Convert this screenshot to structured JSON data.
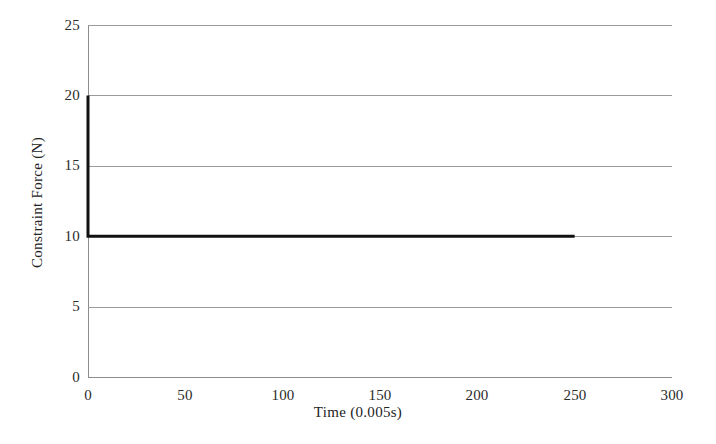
{
  "chart_data": {
    "type": "line",
    "title": "",
    "subtitle": "",
    "xlabel": "Time (0.005s)",
    "ylabel": "Constraint Force (N)",
    "xlim": [
      0,
      300
    ],
    "ylim": [
      0,
      25
    ],
    "x_ticks": [
      0,
      50,
      100,
      150,
      200,
      250,
      300
    ],
    "y_ticks": [
      0,
      5,
      10,
      15,
      20,
      25
    ],
    "x_tick_labels": [
      "0",
      "50",
      "100",
      "150",
      "200",
      "250",
      "300"
    ],
    "y_tick_labels": [
      "0",
      "5",
      "10",
      "15",
      "20",
      "25"
    ],
    "grid": {
      "horizontal": true,
      "vertical": false,
      "color": "#9a9a9a"
    },
    "legend": {
      "visible": false,
      "entries": []
    },
    "annotations": [],
    "series": [
      {
        "name": "Constraint Force",
        "color": "#111111",
        "line_width": 3,
        "x": [
          0,
          0,
          5,
          10,
          20,
          30,
          40,
          50,
          60,
          70,
          80,
          90,
          100,
          110,
          120,
          130,
          140,
          150,
          160,
          170,
          180,
          190,
          200,
          210,
          220,
          230,
          240,
          250
        ],
        "values": [
          20,
          10,
          10,
          10,
          10,
          10,
          10,
          10,
          10,
          10,
          10,
          10,
          10,
          10,
          10,
          10,
          10,
          10,
          10,
          10,
          10,
          10,
          10,
          10,
          10,
          10,
          10,
          10
        ]
      }
    ]
  },
  "axes": {
    "y_label_text": "Constraint Force (N)",
    "x_label_text": "Time (0.005s)"
  }
}
